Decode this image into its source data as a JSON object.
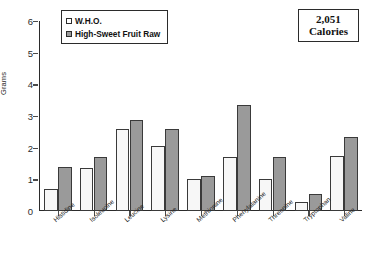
{
  "chart_data": {
    "type": "bar",
    "title": "",
    "xlabel": "",
    "ylabel": "Grams",
    "ylim": [
      0,
      6
    ],
    "yticks": [
      0,
      1,
      2,
      3,
      4,
      5,
      6
    ],
    "ytick_labels": [
      "0",
      "1",
      "2",
      "3",
      "4",
      "5",
      "6"
    ],
    "grid": false,
    "legend_position": "top-left",
    "categories": [
      "Histidine",
      "Isoleucine",
      "Leucine",
      "Lysine",
      "Methionine",
      "Phenylalanine",
      "Threonine",
      "Tryptophan",
      "Valine"
    ],
    "series": [
      {
        "name": "W.H.O.",
        "color": "#f7f7f7",
        "values": [
          0.7,
          1.35,
          2.6,
          2.05,
          1.02,
          1.7,
          1.02,
          0.27,
          1.75
        ]
      },
      {
        "name": "High-Sweet Fruit Raw",
        "color": "#9a9a9a",
        "values": [
          1.4,
          1.72,
          2.88,
          2.58,
          1.1,
          3.35,
          1.72,
          0.55,
          2.33
        ]
      }
    ],
    "annotations": [
      {
        "name": "calories-callout",
        "line1": "2,051",
        "line2": "Calories"
      }
    ]
  },
  "legend": {
    "items": [
      {
        "label": "W.H.O.",
        "swatch": "white-square-swatch"
      },
      {
        "label": "High-Sweet Fruit Raw",
        "swatch": "gray-square-swatch"
      }
    ]
  }
}
